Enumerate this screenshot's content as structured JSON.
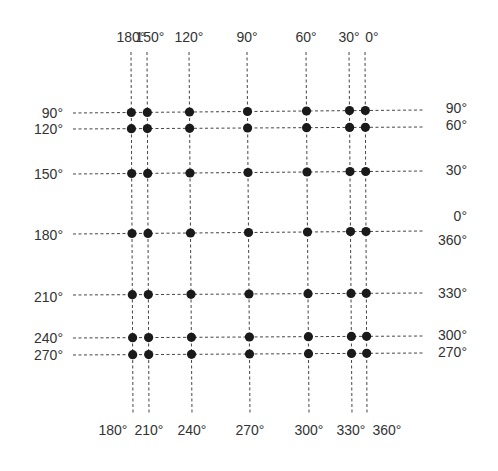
{
  "diagram": {
    "title": "",
    "colors": {
      "line": "#444444",
      "dot": "#1a1a1a",
      "text": "#333333",
      "background": "#ffffff"
    },
    "top_labels": [
      "180°",
      "150°",
      "120°",
      "90°",
      "60°",
      "30°",
      "0°"
    ],
    "bottom_labels": [
      "180°",
      "210°",
      "240°",
      "270°",
      "300°",
      "330°",
      "360°"
    ],
    "left_labels": [
      "90°",
      "120°",
      "150°",
      "180°",
      "210°",
      "240°",
      "270°"
    ],
    "right_labels": [
      "90°",
      "60°",
      "30°",
      "0°\n360°",
      "330°",
      "300°",
      "270°"
    ],
    "right_labels_split": [
      [
        "90°"
      ],
      [
        "60°"
      ],
      [
        "30°"
      ],
      [
        "0°",
        "360°"
      ],
      [
        "330°"
      ],
      [
        "300°"
      ],
      [
        "270°"
      ]
    ],
    "columns": [
      {
        "top": 131,
        "bottom": 133
      },
      {
        "top": 147,
        "bottom": 149
      },
      {
        "top": 189,
        "bottom": 192
      },
      {
        "top": 247,
        "bottom": 250
      },
      {
        "top": 306,
        "bottom": 309
      },
      {
        "top": 349,
        "bottom": 352
      },
      {
        "top": 365,
        "bottom": 367
      }
    ],
    "rows": [
      {
        "left": 113,
        "right": 110
      },
      {
        "left": 129,
        "right": 127
      },
      {
        "left": 174,
        "right": 171
      },
      {
        "left": 234,
        "right": 231
      },
      {
        "left": 295,
        "right": 293
      },
      {
        "left": 338,
        "right": 336
      },
      {
        "left": 355,
        "right": 353
      }
    ],
    "extent": {
      "x_start": 73,
      "x_end": 424,
      "y_start": 52,
      "y_end": 415
    }
  }
}
